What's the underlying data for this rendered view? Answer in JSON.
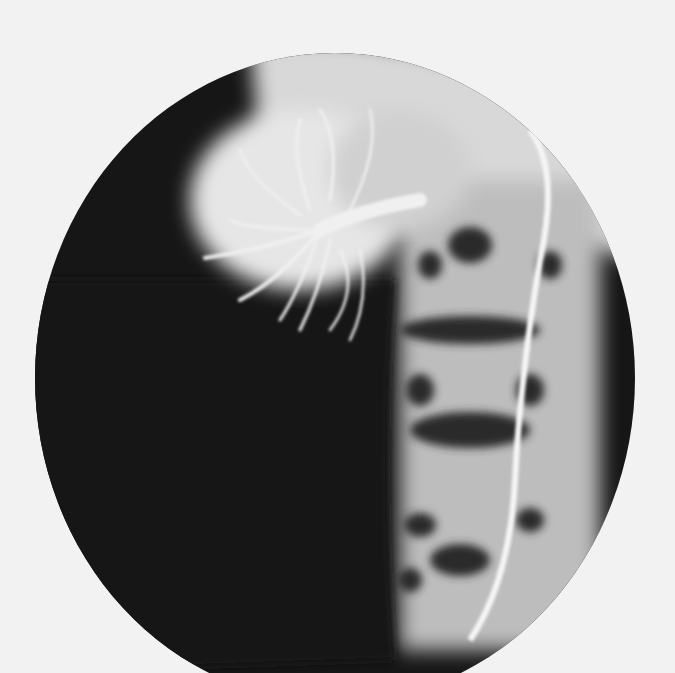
{
  "image": {
    "type": "radiograph",
    "description": "Circular-field angiographic X-ray showing contrast-filled vessels branching in upper-left region, vertebral column and a catheter line on the right side",
    "background_color": "#f2f2f2",
    "field_color": "#141414",
    "contrast_color": "#eaeaea"
  }
}
